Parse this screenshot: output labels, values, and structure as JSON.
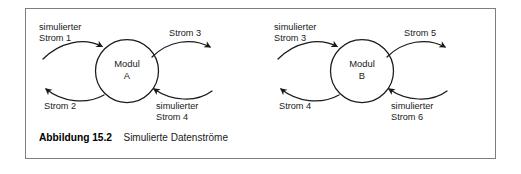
{
  "figure": {
    "caption_number": "Abbildung 15.2",
    "caption_text": "Simulierte Datenströme",
    "border_color": "#7d7d7d",
    "stroke_color": "#1a1a1a",
    "background": "#ffffff"
  },
  "diagram": {
    "type": "data-flow",
    "modules": [
      {
        "id": "module-a",
        "line1": "Modul",
        "line2": "A"
      },
      {
        "id": "module-b",
        "line1": "Modul",
        "line2": "B"
      }
    ],
    "flows": [
      {
        "id": "flow-1",
        "line1": "simulierter",
        "line2": "Strom 1",
        "module": "A",
        "side": "left",
        "direction": "in"
      },
      {
        "id": "flow-2",
        "line1": "Strom 2",
        "line2": "",
        "module": "A",
        "side": "left",
        "direction": "out"
      },
      {
        "id": "flow-3",
        "line1": "Strom 3",
        "line2": "",
        "module": "A",
        "side": "right",
        "direction": "out"
      },
      {
        "id": "flow-4",
        "line1": "simulierter",
        "line2": "Strom 4",
        "module": "A",
        "side": "right",
        "direction": "in"
      },
      {
        "id": "flow-5",
        "line1": "simulierter",
        "line2": "Strom 3",
        "module": "B",
        "side": "left",
        "direction": "in"
      },
      {
        "id": "flow-6",
        "line1": "Strom 4",
        "line2": "",
        "module": "B",
        "side": "left",
        "direction": "out"
      },
      {
        "id": "flow-7",
        "line1": "Strom 5",
        "line2": "",
        "module": "B",
        "side": "right",
        "direction": "out"
      },
      {
        "id": "flow-8",
        "line1": "simulierter",
        "line2": "Strom 6",
        "module": "B",
        "side": "right",
        "direction": "in"
      }
    ]
  }
}
